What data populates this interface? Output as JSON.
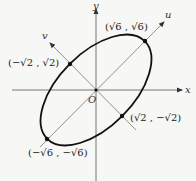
{
  "diagram": {
    "type": "rotated-ellipse",
    "axes": {
      "x_label": "x",
      "y_label": "y",
      "u_label": "u",
      "v_label": "v",
      "origin_label": "O"
    },
    "points": [
      {
        "id": "p1",
        "label": "(√6 , √6)"
      },
      {
        "id": "p2",
        "label": "(−√2 , √2)"
      },
      {
        "id": "p3",
        "label": "(√2 , −√2)"
      },
      {
        "id": "p4",
        "label": "(−√6 , −√6)"
      }
    ],
    "colors": {
      "background": "#f7f7f5",
      "ellipse": "#111111",
      "axes": "#444444",
      "rotated_axes": "#555555"
    }
  }
}
